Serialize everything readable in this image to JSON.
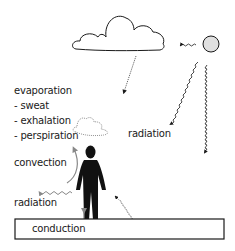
{
  "diagram": {
    "labels": {
      "evaporation": "evaporation",
      "sweat": "- sweat",
      "exhalation": "- exhalation",
      "perspiration": "- perspiration",
      "radiation_sun": "radiation",
      "convection": "convection",
      "radiation_body": "radiation",
      "conduction": "conduction"
    },
    "elements": [
      "cloud",
      "sun",
      "person",
      "ground",
      "vapor-cloud"
    ],
    "colors": {
      "stroke": "#1a1a1a",
      "sun_fill": "#e0e0e0",
      "person_fill": "#111111",
      "gray_arrow": "#888888"
    }
  }
}
